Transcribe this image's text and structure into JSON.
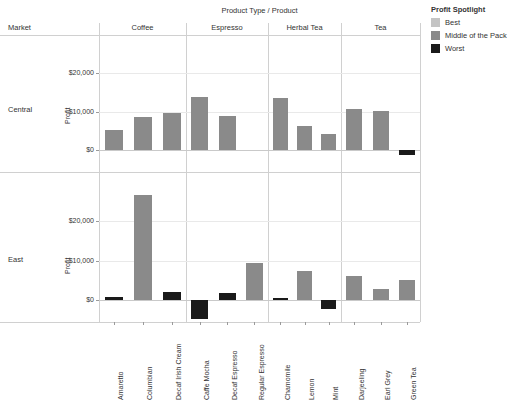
{
  "header": {
    "column_field_title": "Product Type  /  Product",
    "row_field_title": "Market"
  },
  "legend": {
    "title": "Profit Spotlight",
    "items": [
      {
        "label": "Best",
        "color": "#c4c4c4"
      },
      {
        "label": "Middle of the Pack",
        "color": "#8a8a8a"
      },
      {
        "label": "Worst",
        "color": "#1a1a1a"
      }
    ]
  },
  "axis": {
    "y_title": "Profit",
    "y_ticks": [
      "$20,000",
      "$10,000",
      "$0"
    ]
  },
  "chart_data": {
    "type": "bar",
    "title": "Product Type  /  Product",
    "xlabel": "",
    "ylabel": "Profit",
    "ylim": [
      -6000,
      28000
    ],
    "grid": true,
    "legend_position": "right",
    "row_field": "Market",
    "column_field": "Product Type",
    "column_groups": [
      "Coffee",
      "Espresso",
      "Herbal Tea",
      "Tea"
    ],
    "categories": [
      "Amaretto",
      "Columbian",
      "Decaf Irish Cream",
      "Caffe Mocha",
      "Decaf Espresso",
      "Regular Espresso",
      "Chamomile",
      "Lemon",
      "Mint",
      "Darjeeling",
      "Earl Grey",
      "Green Tea"
    ],
    "category_groups": [
      "Coffee",
      "Coffee",
      "Coffee",
      "Espresso",
      "Espresso",
      "Espresso",
      "Herbal Tea",
      "Herbal Tea",
      "Herbal Tea",
      "Tea",
      "Tea",
      "Tea"
    ],
    "panels": [
      {
        "name": "Central",
        "values": [
          5100,
          8500,
          9700,
          13900,
          8800,
          null,
          13700,
          6200,
          4100,
          10600,
          10100,
          -1400
        ],
        "spotlight": [
          "Middle of the Pack",
          "Middle of the Pack",
          "Middle of the Pack",
          "Middle of the Pack",
          "Middle of the Pack",
          null,
          "Middle of the Pack",
          "Middle of the Pack",
          "Middle of the Pack",
          "Middle of the Pack",
          "Middle of the Pack",
          "Worst"
        ]
      },
      {
        "name": "East",
        "values": [
          700,
          26600,
          1900,
          -4700,
          1800,
          9400,
          600,
          7400,
          -2200,
          6000,
          2900,
          5000
        ],
        "spotlight": [
          "Worst",
          "Middle of the Pack",
          "Worst",
          "Worst",
          "Worst",
          "Middle of the Pack",
          "Worst",
          "Middle of the Pack",
          "Worst",
          "Middle of the Pack",
          "Middle of the Pack",
          "Middle of the Pack"
        ]
      }
    ]
  }
}
